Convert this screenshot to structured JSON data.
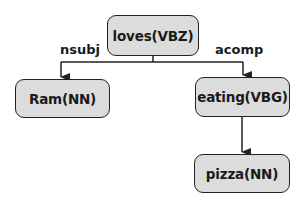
{
  "diagram": {
    "type": "dependency-parse-tree",
    "nodes": [
      {
        "id": "loves",
        "label": "loves(VBZ)"
      },
      {
        "id": "ram",
        "label": "Ram(NN)"
      },
      {
        "id": "eating",
        "label": "eating(VBG)"
      },
      {
        "id": "pizza",
        "label": "pizza(NN)"
      }
    ],
    "edges": [
      {
        "from": "loves",
        "to": "ram",
        "label": "nsubj"
      },
      {
        "from": "loves",
        "to": "eating",
        "label": "acomp"
      },
      {
        "from": "eating",
        "to": "pizza",
        "label": ""
      }
    ],
    "colors": {
      "node_fill": "#dcdcdc",
      "stroke": "#222222",
      "text": "#1a1a1a"
    }
  }
}
